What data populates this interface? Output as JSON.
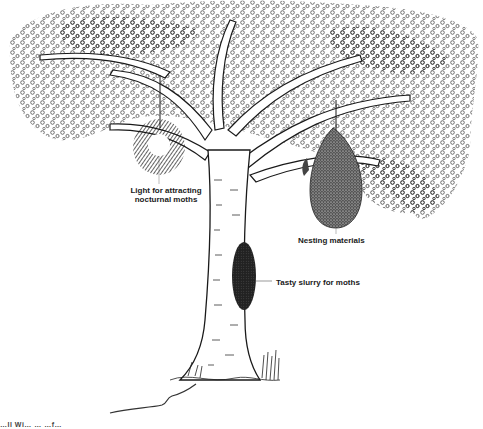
{
  "illustration": {
    "subject": "tree-with-hanging-moth-light-and-nesting-bag",
    "style": "pen-and-ink"
  },
  "labels": {
    "light": [
      "Light for attracting",
      "nocturnal moths"
    ],
    "nest": "Nesting materials",
    "slurry": "Tasty slurry for moths"
  },
  "footer": {
    "cropped_text": "…ll Wi… … …f…"
  },
  "colors": {
    "ink": "#1a1a1a",
    "paper": "#ffffff"
  }
}
